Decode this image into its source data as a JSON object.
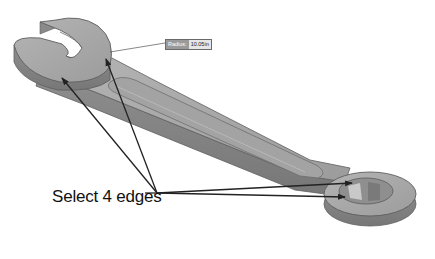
{
  "annotation": {
    "callout_text": "Select 4 edges",
    "dimension_label": "Radius:",
    "dimension_value": "10.05in"
  },
  "colors": {
    "wrench_top": "#a9a9a9",
    "wrench_side": "#8c8c8c",
    "wrench_edge": "#5e5e5e",
    "arrow": "#222222",
    "background": "#ffffff"
  },
  "model": {
    "name": "combination wrench",
    "arrows": 4
  }
}
